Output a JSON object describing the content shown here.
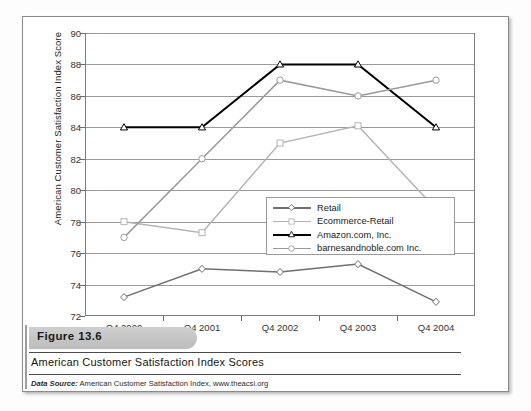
{
  "figure": {
    "band_label": "Figure 13.6",
    "caption_title": "American Customer Satisfaction Index Scores",
    "source_prefix": "Data Source:",
    "source_text": " American Customer Satisfaction Index, www.theacsi.org"
  },
  "chart_data": {
    "type": "line",
    "title": "",
    "xlabel": "",
    "ylabel": "American Customer Satisfaction Index Score",
    "categories": [
      "Q4 2000",
      "Q4 2001",
      "Q4 2002",
      "Q4 2003",
      "Q4 2004"
    ],
    "ylim": [
      72,
      90
    ],
    "ytick_step": 2,
    "yticks": [
      90,
      88,
      86,
      84,
      82,
      80,
      78,
      76,
      74,
      72
    ],
    "grid": true,
    "legend_position": "inside-center-right",
    "series": [
      {
        "name": "Retail",
        "values": [
          73.2,
          75.0,
          74.8,
          75.3,
          72.9
        ],
        "color": "#6f6f6f",
        "marker": "diamond",
        "marker_icon": "diamond-marker-icon"
      },
      {
        "name": "Ecommerce-Retail",
        "values": [
          78.0,
          77.3,
          83.0,
          84.1,
          78.8
        ],
        "color": "#b4b4b4",
        "marker": "square",
        "marker_icon": "square-marker-icon"
      },
      {
        "name": "Amazon.com, Inc.",
        "values": [
          84,
          84,
          88,
          88,
          84
        ],
        "color": "#000000",
        "marker": "triangle",
        "marker_icon": "triangle-marker-icon"
      },
      {
        "name": "barnesandnoble.com Inc.",
        "values": [
          77,
          82,
          87,
          86,
          87
        ],
        "color": "#9a9a9a",
        "marker": "circle",
        "marker_icon": "circle-marker-icon"
      }
    ]
  }
}
